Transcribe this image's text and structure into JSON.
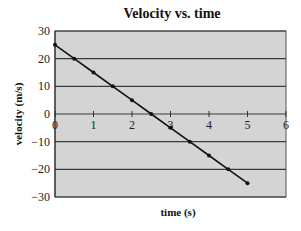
{
  "chart_data": {
    "type": "line",
    "title": "Velocity vs. time",
    "xlabel": "time (s)",
    "ylabel": "velocity (m/s)",
    "xlim": [
      0,
      6
    ],
    "ylim": [
      -30,
      30
    ],
    "x_ticks": [
      0,
      1,
      2,
      3,
      4,
      5,
      6
    ],
    "y_ticks": [
      30,
      20,
      10,
      0,
      -10,
      -20,
      -30
    ],
    "grid": {
      "horizontal": true,
      "vertical": false
    },
    "legend": null,
    "series": [
      {
        "name": "velocity",
        "x": [
          0,
          0.5,
          1,
          1.5,
          2,
          2.5,
          3,
          3.5,
          4,
          4.5,
          5
        ],
        "values": [
          25,
          20,
          15,
          10,
          5,
          0,
          -5,
          -10,
          -15,
          -20,
          -25
        ],
        "markers": true
      }
    ],
    "colors": {
      "plot_bg": "#d4d4d4",
      "gridline": "#3a3a3a",
      "line": "#111111"
    }
  }
}
